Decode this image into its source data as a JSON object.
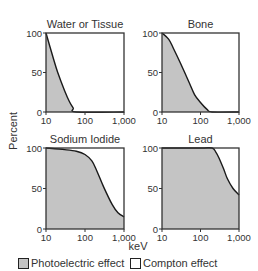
{
  "chart_data": [
    {
      "type": "area",
      "title": "Water or Tissue",
      "xscale": "log",
      "xlabel": "keV",
      "ylabel": "Percent",
      "xlim": [
        10,
        1000
      ],
      "ylim": [
        0,
        100
      ],
      "xticks": [
        "10",
        "100",
        "1,000"
      ],
      "yticks": [
        "0",
        "50",
        "100"
      ],
      "series": [
        {
          "name": "Photoelectric effect",
          "x": [
            10,
            15,
            20,
            30,
            40,
            50,
            60,
            1000
          ],
          "values": [
            100,
            70,
            50,
            27,
            13,
            5,
            0,
            0
          ]
        },
        {
          "name": "Compton effect",
          "x": [
            10,
            15,
            20,
            30,
            40,
            50,
            60,
            1000
          ],
          "values": [
            0,
            30,
            50,
            73,
            87,
            95,
            100,
            100
          ]
        }
      ]
    },
    {
      "type": "area",
      "title": "Bone",
      "xscale": "log",
      "xlabel": "keV",
      "ylabel": "Percent",
      "xlim": [
        10,
        1000
      ],
      "ylim": [
        0,
        100
      ],
      "xticks": [
        "10",
        "100",
        "1,000"
      ],
      "yticks": [
        "0",
        "50",
        "100"
      ],
      "series": [
        {
          "name": "Photoelectric effect",
          "x": [
            10,
            15,
            20,
            30,
            50,
            70,
            100,
            150,
            200,
            1000
          ],
          "values": [
            100,
            92,
            80,
            62,
            38,
            22,
            12,
            3,
            0,
            0
          ]
        },
        {
          "name": "Compton effect",
          "x": [
            10,
            15,
            20,
            30,
            50,
            70,
            100,
            150,
            200,
            1000
          ],
          "values": [
            0,
            8,
            20,
            38,
            62,
            78,
            88,
            97,
            100,
            100
          ]
        }
      ]
    },
    {
      "type": "area",
      "title": "Sodium Iodide",
      "xscale": "log",
      "xlabel": "keV",
      "ylabel": "Percent",
      "xlim": [
        10,
        1000
      ],
      "ylim": [
        0,
        100
      ],
      "xticks": [
        "10",
        "100",
        "1,000"
      ],
      "yticks": [
        "0",
        "50",
        "100"
      ],
      "series": [
        {
          "name": "Photoelectric effect",
          "x": [
            10,
            30,
            60,
            100,
            150,
            200,
            300,
            500,
            700,
            1000
          ],
          "values": [
            100,
            98,
            96,
            92,
            84,
            72,
            52,
            30,
            20,
            15
          ]
        },
        {
          "name": "Compton effect",
          "x": [
            10,
            30,
            60,
            100,
            150,
            200,
            300,
            500,
            700,
            1000
          ],
          "values": [
            0,
            2,
            4,
            8,
            16,
            28,
            48,
            70,
            80,
            85
          ]
        }
      ]
    },
    {
      "type": "area",
      "title": "Lead",
      "xscale": "log",
      "xlabel": "keV",
      "ylabel": "Percent",
      "xlim": [
        10,
        1000
      ],
      "ylim": [
        0,
        100
      ],
      "xticks": [
        "10",
        "100",
        "1,000"
      ],
      "yticks": [
        "0",
        "50",
        "100"
      ],
      "series": [
        {
          "name": "Photoelectric effect",
          "x": [
            10,
            100,
            200,
            250,
            300,
            400,
            500,
            700,
            1000
          ],
          "values": [
            100,
            100,
            100,
            95,
            88,
            74,
            62,
            50,
            42
          ]
        },
        {
          "name": "Compton effect",
          "x": [
            10,
            100,
            200,
            250,
            300,
            400,
            500,
            700,
            1000
          ],
          "values": [
            0,
            0,
            0,
            5,
            12,
            26,
            38,
            50,
            58
          ]
        }
      ]
    }
  ],
  "labels": {
    "y_axis": "Percent",
    "x_axis": "keV"
  },
  "legend": [
    {
      "label": "Photoelectric effect",
      "color": "#c4c4c4"
    },
    {
      "label": "Compton effect",
      "color": "#ffffff"
    }
  ],
  "colors": {
    "fill": "#c4c4c4",
    "line": "#1a1a1a",
    "frame": "#333333"
  }
}
